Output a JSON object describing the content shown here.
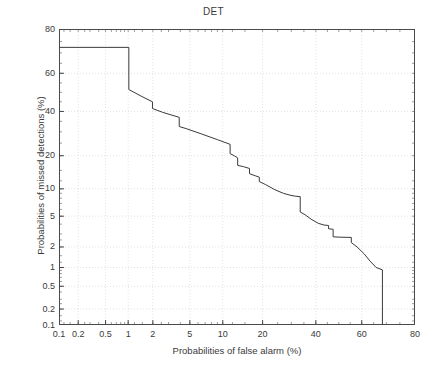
{
  "figure": {
    "title": "DET",
    "caption": ""
  },
  "chart_data": {
    "type": "line",
    "title": "DET",
    "xlabel": "Probabilities of false alarm (%)",
    "ylabel": "Probabilities of missed detections (%)",
    "xscale": "probit",
    "yscale": "probit",
    "xlim": [
      0.1,
      80
    ],
    "ylim": [
      0.1,
      80
    ],
    "grid": true,
    "legend": null,
    "xticks": [
      0.1,
      0.2,
      0.5,
      1,
      2,
      5,
      10,
      20,
      40,
      60,
      80
    ],
    "xticklabels": [
      "0.1",
      "0.2",
      "0.5",
      "1",
      "2",
      "5",
      "10",
      "20",
      "40",
      "60",
      "80"
    ],
    "yticks": [
      0.1,
      0.2,
      0.5,
      1,
      2,
      5,
      10,
      20,
      40,
      60,
      80
    ],
    "yticklabels": [
      "0.1",
      "0.2",
      "0.5",
      "1",
      "2",
      "5",
      "10",
      "20",
      "40",
      "60",
      "80"
    ],
    "series": [
      {
        "name": "DET curve",
        "color": "#3a3a3a",
        "linewidth": 1,
        "x": [
          0.1,
          1.02,
          1.02,
          1.45,
          1.98,
          1.98,
          2.6,
          3.9,
          3.9,
          4.6,
          6.5,
          9.0,
          11.5,
          11.5,
          12.4,
          13.2,
          13.2,
          14.6,
          16.2,
          16.2,
          17.8,
          19.0,
          19.0,
          21.0,
          24.0,
          27.0,
          29.5,
          31.5,
          33.5,
          33.5,
          35.5,
          38.0,
          41.0,
          43.5,
          45.5,
          45.5,
          47.5,
          47.5,
          50.5,
          55.5,
          55.5,
          58.0,
          61.0,
          63.5,
          66.0,
          68.5,
          68.5
        ],
        "y": [
          72.5,
          72.5,
          51.5,
          48.0,
          45.0,
          41.5,
          39.5,
          37.0,
          32.5,
          31.5,
          29.0,
          26.5,
          24.5,
          20.8,
          20.0,
          19.2,
          16.6,
          16.2,
          15.6,
          14.0,
          13.4,
          13.0,
          11.8,
          11.0,
          9.8,
          9.0,
          8.6,
          8.4,
          8.3,
          5.6,
          5.2,
          4.6,
          4.1,
          3.9,
          3.85,
          3.5,
          3.45,
          2.75,
          2.72,
          2.7,
          2.3,
          2.0,
          1.6,
          1.25,
          1.0,
          0.92,
          0.1
        ]
      }
    ]
  }
}
